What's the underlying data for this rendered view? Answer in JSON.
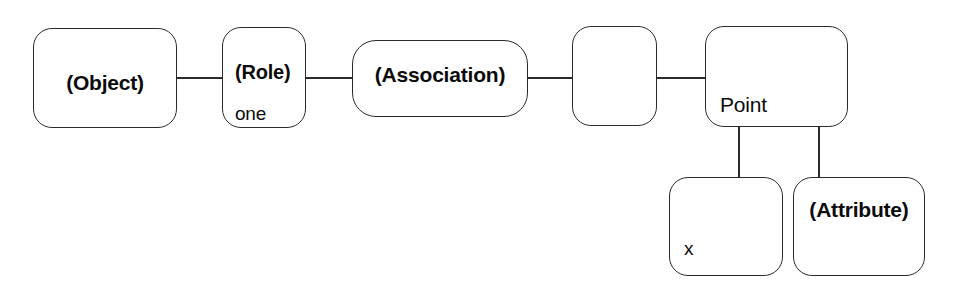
{
  "diagram": {
    "background_color": "#ffffff",
    "stroke_color": "#2b2b2b",
    "text_color": "#0b0b0b",
    "nodes": [
      {
        "id": "object",
        "label": "(Object)",
        "style": "bold",
        "align": "center"
      },
      {
        "id": "role",
        "label": "(Role)",
        "value": "one",
        "style": "bold",
        "align": "left"
      },
      {
        "id": "association",
        "label": "(Association)",
        "style": "bold",
        "align": "center"
      },
      {
        "id": "empty",
        "label": "",
        "style": "regular",
        "align": "center"
      },
      {
        "id": "point",
        "label": "Point",
        "style": "regular",
        "align": "left"
      },
      {
        "id": "x",
        "label": "x",
        "style": "regular",
        "align": "left"
      },
      {
        "id": "attribute",
        "label": "(Attribute)",
        "style": "bold",
        "align": "center"
      }
    ],
    "connectors": [
      {
        "id": "object-role",
        "from": "object",
        "to": "role",
        "orientation": "horizontal"
      },
      {
        "id": "role-association",
        "from": "role",
        "to": "association",
        "orientation": "horizontal"
      },
      {
        "id": "association-empty",
        "from": "association",
        "to": "empty",
        "orientation": "horizontal"
      },
      {
        "id": "empty-point",
        "from": "empty",
        "to": "point",
        "orientation": "horizontal"
      },
      {
        "id": "point-x",
        "from": "point",
        "to": "x",
        "orientation": "vertical"
      },
      {
        "id": "point-attribute",
        "from": "point",
        "to": "attribute",
        "orientation": "vertical"
      }
    ]
  }
}
